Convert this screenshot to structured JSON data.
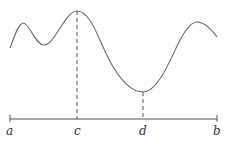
{
  "diagram": {
    "labels": {
      "a": "a",
      "c": "c",
      "d": "d",
      "b": "b"
    },
    "points": {
      "max_at": "c",
      "min_at": "d"
    }
  }
}
